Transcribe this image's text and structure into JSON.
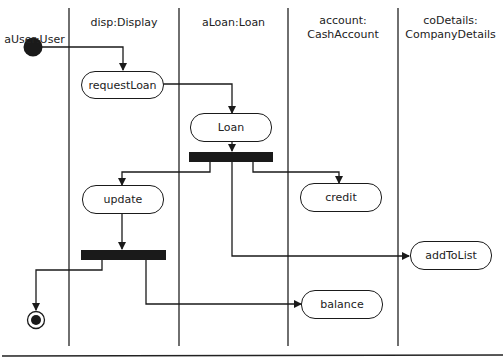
{
  "diagram": {
    "type": "UML activity diagram with swimlanes",
    "lanes": [
      {
        "label": "aUser:User"
      },
      {
        "label": "disp:Display"
      },
      {
        "label": "aLoan:Loan"
      },
      {
        "label_line1": "account:",
        "label_line2": "CashAccount"
      },
      {
        "label_line1": "coDetails:",
        "label_line2": "CompanyDetails"
      }
    ],
    "activities": {
      "requestLoan": "requestLoan",
      "loan": "Loan",
      "update": "update",
      "credit": "credit",
      "addToList": "addToList",
      "balance": "balance"
    },
    "colors": {
      "line": "#1a1a1a",
      "fill": "#ffffff"
    }
  }
}
